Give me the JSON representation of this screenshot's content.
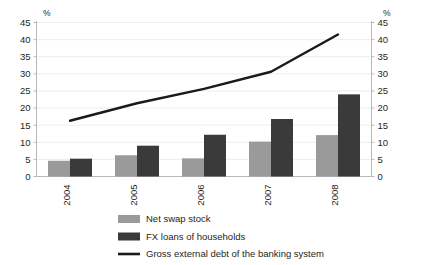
{
  "chart_data": {
    "type": "bar",
    "title": "",
    "subtitle": "",
    "xlabel": "",
    "ylabel": "%",
    "ylabel_right": "%",
    "categories": [
      "2004",
      "2005",
      "2006",
      "2007",
      "2008"
    ],
    "ylim": [
      0,
      45
    ],
    "ylim_right": [
      0,
      45
    ],
    "yticks": [
      0,
      5,
      10,
      15,
      20,
      25,
      30,
      35,
      40,
      45
    ],
    "yticks_right": [
      0,
      5,
      10,
      15,
      20,
      25,
      30,
      35,
      40,
      45
    ],
    "grid": true,
    "legend_position": "bottom",
    "series": [
      {
        "name": "Net swap stock",
        "type": "bar",
        "color": "#9a9a9a",
        "values": [
          4.6,
          6.2,
          5.3,
          10.2,
          12.1
        ]
      },
      {
        "name": "FX loans of households",
        "type": "bar",
        "color": "#3a3a3a",
        "values": [
          5.2,
          9.0,
          12.2,
          16.8,
          24.0
        ]
      },
      {
        "name": "Gross external debt of the banking system",
        "type": "line",
        "color": "#1a1a1a",
        "values": [
          16.3,
          21.4,
          25.6,
          30.6,
          41.5
        ]
      }
    ],
    "axis_tick_labels_left": [
      "45",
      "40",
      "35",
      "30",
      "25",
      "20",
      "15",
      "10",
      "5",
      "0"
    ],
    "axis_tick_labels_right": [
      "45",
      "40",
      "35",
      "30",
      "25",
      "20",
      "15",
      "10",
      "5",
      "0"
    ]
  },
  "legend": {
    "items": [
      {
        "label": "Net swap stock",
        "marker": "swatch",
        "color": "#9a9a9a"
      },
      {
        "label": "FX loans of households",
        "marker": "swatch",
        "color": "#3a3a3a"
      },
      {
        "label": "Gross external debt of the banking system",
        "marker": "line",
        "color": "#1a1a1a"
      }
    ]
  },
  "axes": {
    "left_unit": "%",
    "right_unit": "%"
  },
  "colors": {
    "background": "#ffffff",
    "grid": "#e8e8e8",
    "axis": "#b9b9b9",
    "text": "#231f20",
    "series_bar_1": "#9a9a9a",
    "series_bar_2": "#3a3a3a",
    "series_line": "#1a1a1a"
  }
}
